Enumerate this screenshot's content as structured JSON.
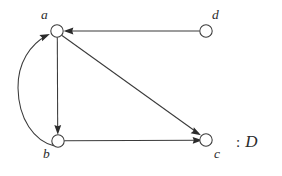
{
  "figure": {
    "caption_colon": ":",
    "caption_name": "D",
    "background_color": "#ffffff",
    "stroke_color": "#3a3a3a",
    "text_color": "#2b2b2b"
  },
  "graph": {
    "type": "directed-graph",
    "nodes": [
      {
        "id": "a",
        "label": "a",
        "cx": 57,
        "cy": 31,
        "r": 6.2,
        "label_x": 41,
        "label_y": 8
      },
      {
        "id": "b",
        "label": "b",
        "cx": 58,
        "cy": 141,
        "r": 6.2,
        "label_x": 43,
        "label_y": 147
      },
      {
        "id": "c",
        "label": "c",
        "cx": 206,
        "cy": 140,
        "r": 6.2,
        "label_x": 214,
        "label_y": 147
      },
      {
        "id": "d",
        "label": "d",
        "cx": 206,
        "cy": 31,
        "r": 6.2,
        "label_x": 212,
        "label_y": 8
      }
    ],
    "edges": [
      {
        "from": "d",
        "to": "a",
        "shape": "straight",
        "description": "horizontal arrow from d leftward to a"
      },
      {
        "from": "a",
        "to": "b",
        "shape": "straight",
        "description": "vertical arrow from a down to b"
      },
      {
        "from": "a",
        "to": "c",
        "shape": "straight",
        "description": "diagonal arrow from a down-right to c"
      },
      {
        "from": "b",
        "to": "c",
        "shape": "straight",
        "description": "horizontal arrow from b right to c"
      },
      {
        "from": "b",
        "to": "a",
        "shape": "curved",
        "description": "curved arrow bulging left from b up to a"
      }
    ]
  }
}
